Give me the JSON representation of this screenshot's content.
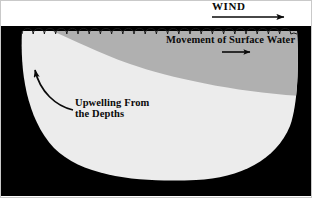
{
  "figure": {
    "type": "scientific-diagram",
    "labels": {
      "wind": "WIND",
      "surface_movement": "Movement of  Surface Water",
      "upwelling_line1": "Upwelling From",
      "upwelling_line2": "the Depths"
    },
    "arrows": {
      "wind_arrow": "arrow-right-icon",
      "surface_arrow": "arrow-right-icon",
      "upwelling_arrow": "curved-arrow-up-icon"
    },
    "regions": {
      "land": "land-mass",
      "deep_water": "deep-water-body",
      "surface_water": "warm-surface-water-layer",
      "sea_surface": "wavy-sea-surface-line"
    },
    "colors": {
      "land": "#000000",
      "deep_water": "#ececec",
      "surface_water": "#b0b0b0",
      "sky": "#ffffff",
      "ink": "#0a0a0a",
      "border": "#c9c9c9"
    }
  }
}
